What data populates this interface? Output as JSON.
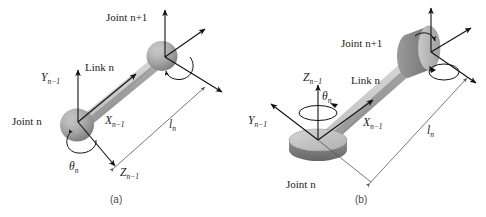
{
  "figure": {
    "type": "diagram",
    "background_color": "#ffffff",
    "line_color": "#111111",
    "link_light_color": "#c9c9c9",
    "link_mid_color": "#a9a9a9",
    "link_dark_color": "#8a8a8a",
    "joint_light_color": "#c2c2c2",
    "joint_mid_color": "#9d9d9d",
    "joint_dark_color": "#6f6f6f"
  },
  "panels": [
    {
      "id": "a",
      "caption": "(a)",
      "labels": {
        "joint_lower": "Joint n",
        "joint_upper": "Joint n+1",
        "link": "Link n",
        "axis_y": "Y",
        "axis_y_sub": "n−1",
        "axis_x": "X",
        "axis_x_sub": "n−1",
        "axis_z": "Z",
        "axis_z_sub": "n−1",
        "theta": "θ",
        "theta_sub": "n",
        "length": "l",
        "length_sub": "n"
      }
    },
    {
      "id": "b",
      "caption": "(b)",
      "labels": {
        "joint_lower": "Joint n",
        "joint_upper": "Joint n+1",
        "link": "Link n",
        "axis_y": "Y",
        "axis_y_sub": "n−1",
        "axis_x": "X",
        "axis_x_sub": "n−1",
        "axis_z": "Z",
        "axis_z_sub": "n−1",
        "theta": "θ",
        "theta_sub": "n",
        "length": "l",
        "length_sub": "n"
      }
    }
  ]
}
